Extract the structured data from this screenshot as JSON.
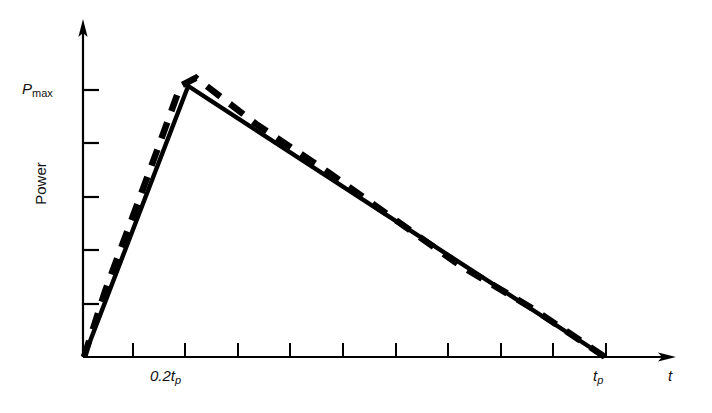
{
  "chart_data": {
    "type": "line",
    "title": "",
    "xlabel": "t",
    "ylabel": "Power",
    "grid": false,
    "legend": "none",
    "xlim": [
      0,
      1.14
    ],
    "ylim": [
      0,
      1.24
    ],
    "axis_style": "arrow-tipped open axes (L-shaped), ticks only, no numeric tick labels",
    "annotations": {
      "y_axis_title": "Power",
      "y_tick_label": "P",
      "y_tick_label_subscript": "max",
      "x_tick_label_peak": "0.2t",
      "x_tick_label_peak_subscript": "p",
      "x_tick_label_end": "t",
      "x_tick_label_end_subscript": "p",
      "x_axis_title": "t"
    },
    "x_ticks": [
      0.1,
      0.2,
      0.3,
      0.4,
      0.5,
      0.6,
      0.7,
      0.8,
      0.9,
      1.0
    ],
    "x_tick_labels": [
      "",
      "0.2tp",
      "",
      "",
      "",
      "",
      "",
      "",
      "",
      "tp"
    ],
    "y_ticks": [
      0.2,
      0.4,
      0.6,
      0.8,
      1.0
    ],
    "y_tick_labels": [
      "",
      "",
      "",
      "",
      "Pmax"
    ],
    "series": [
      {
        "name": "idealized triangular pulse",
        "style": "solid",
        "color": "#000000",
        "points": [
          {
            "x": 0.0,
            "y": 0.0
          },
          {
            "x": 0.2,
            "y": 1.0
          },
          {
            "x": 1.0,
            "y": 0.0
          }
        ]
      },
      {
        "name": "actual pulse shape",
        "style": "dashed",
        "color": "#000000",
        "points": [
          {
            "x": 0.0,
            "y": 0.0
          },
          {
            "x": 0.04,
            "y": 0.24
          },
          {
            "x": 0.09,
            "y": 0.5
          },
          {
            "x": 0.14,
            "y": 0.76
          },
          {
            "x": 0.185,
            "y": 1.0
          },
          {
            "x": 0.215,
            "y": 1.03
          },
          {
            "x": 0.33,
            "y": 0.86
          },
          {
            "x": 0.47,
            "y": 0.68
          },
          {
            "x": 0.58,
            "y": 0.53
          },
          {
            "x": 0.72,
            "y": 0.34
          },
          {
            "x": 0.86,
            "y": 0.18
          },
          {
            "x": 1.0,
            "y": 0.0
          }
        ]
      }
    ]
  },
  "labels": {
    "power": "Power",
    "pmax_main": "P",
    "pmax_sub": "max",
    "tp_peak_main": "0.2t",
    "tp_peak_sub": "p",
    "tp_end_main": "t",
    "tp_end_sub": "p",
    "t_axis": "t"
  },
  "colors": {
    "ink": "#000000",
    "background": "#ffffff"
  }
}
